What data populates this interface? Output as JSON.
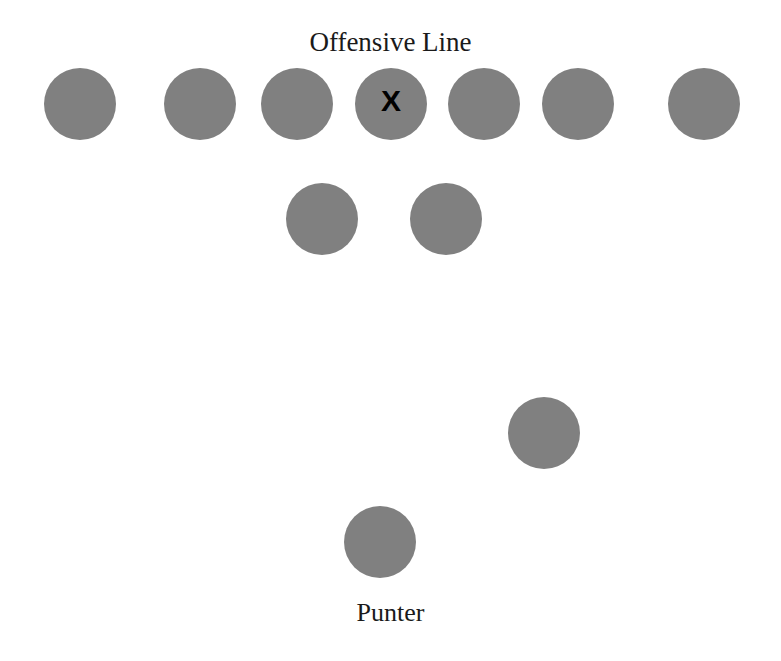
{
  "diagram": {
    "title": "Offensive Line",
    "punter_label": "Punter",
    "background_color": "#ffffff",
    "player_color": "#808080",
    "mark_color": "#000000",
    "width": 781,
    "height": 661
  },
  "chart_data": {
    "type": "scatter",
    "title": "Offensive Line",
    "xlabel": "",
    "ylabel": "",
    "xlim": [
      0,
      781
    ],
    "ylim": [
      0,
      661
    ],
    "grid": false,
    "legend": null,
    "annotations": [
      {
        "text": "Offensive Line",
        "x": 390,
        "y": 42
      },
      {
        "text": "Punter",
        "x": 385,
        "y": 612
      }
    ],
    "marker_color": "#808080",
    "marker_diameter": 72,
    "series": [
      {
        "name": "Offensive Line",
        "values": [
          {
            "label": "left-wing",
            "x": 80,
            "y": 104,
            "mark": ""
          },
          {
            "label": "left-tackle",
            "x": 200,
            "y": 104,
            "mark": ""
          },
          {
            "label": "left-guard",
            "x": 297,
            "y": 104,
            "mark": ""
          },
          {
            "label": "center",
            "x": 391,
            "y": 104,
            "mark": "X"
          },
          {
            "label": "right-guard",
            "x": 484,
            "y": 104,
            "mark": ""
          },
          {
            "label": "right-tackle",
            "x": 578,
            "y": 104,
            "mark": ""
          },
          {
            "label": "right-wing",
            "x": 704,
            "y": 104,
            "mark": ""
          }
        ]
      },
      {
        "name": "Upbacks",
        "values": [
          {
            "label": "left-upback",
            "x": 322,
            "y": 219,
            "mark": ""
          },
          {
            "label": "right-upback",
            "x": 446,
            "y": 219,
            "mark": ""
          }
        ]
      },
      {
        "name": "Personal Protector",
        "values": [
          {
            "label": "personal-protector",
            "x": 544,
            "y": 433,
            "mark": ""
          }
        ]
      },
      {
        "name": "Punter",
        "values": [
          {
            "label": "punter",
            "x": 380,
            "y": 542,
            "mark": ""
          }
        ]
      }
    ]
  }
}
